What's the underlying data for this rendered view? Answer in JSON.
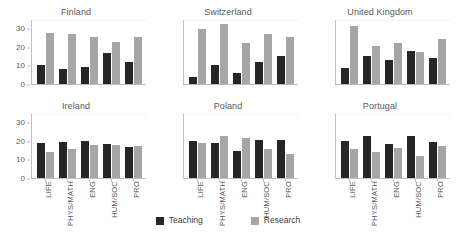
{
  "chart_data": {
    "type": "bar",
    "title": "",
    "subtitle": "",
    "xlabel": "",
    "ylabel": "",
    "ylim": [
      0,
      35
    ],
    "yticks": [
      0,
      10,
      20,
      30
    ],
    "ytick_labels": [
      "0",
      "10",
      "20",
      "30"
    ],
    "grid": true,
    "legend_position": "bottom-center",
    "categories": [
      "LIFE",
      "PHYS/MATH",
      "ENG",
      "HUM/SOC",
      "PRO"
    ],
    "series_names": [
      "Teaching",
      "Research"
    ],
    "series_colors": [
      "#262626",
      "#a6a6a6"
    ],
    "facet_layout": [
      2,
      3
    ],
    "panels": [
      {
        "title": "Finland",
        "series": [
          {
            "name": "Teaching",
            "values": [
              10.5,
              8,
              9.5,
              17,
              12
            ]
          },
          {
            "name": "Research",
            "values": [
              28,
              27.5,
              25.5,
              23,
              25.5
            ]
          }
        ]
      },
      {
        "title": "Switzerland",
        "series": [
          {
            "name": "Teaching",
            "values": [
              4,
              10.5,
              6,
              12,
              15.5
            ]
          },
          {
            "name": "Research",
            "values": [
              30,
              33,
              22.5,
              27.5,
              25.5
            ]
          }
        ]
      },
      {
        "title": "United Kingdom",
        "series": [
          {
            "name": "Teaching",
            "values": [
              9,
              15.5,
              13,
              18,
              14
            ]
          },
          {
            "name": "Research",
            "values": [
              32,
              21,
              22.5,
              17.5,
              24.5
            ]
          }
        ]
      },
      {
        "title": "Ireland",
        "series": [
          {
            "name": "Teaching",
            "values": [
              19,
              19.5,
              20,
              18.5,
              17
            ]
          },
          {
            "name": "Research",
            "values": [
              14,
              16,
              18,
              18,
              17.5
            ]
          }
        ]
      },
      {
        "title": "Poland",
        "series": [
          {
            "name": "Teaching",
            "values": [
              20,
              19,
              15,
              21,
              21
            ]
          },
          {
            "name": "Research",
            "values": [
              19,
              23,
              22,
              16,
              13
            ]
          }
        ]
      },
      {
        "title": "Portugal",
        "series": [
          {
            "name": "Teaching",
            "values": [
              20,
              23,
              18.5,
              23,
              19.5
            ]
          },
          {
            "name": "Research",
            "values": [
              16,
              14,
              16.5,
              12,
              17.5
            ]
          }
        ]
      }
    ]
  },
  "legend": {
    "items": [
      {
        "label": "Teaching",
        "color": "#262626"
      },
      {
        "label": "Research",
        "color": "#a6a6a6"
      }
    ]
  }
}
